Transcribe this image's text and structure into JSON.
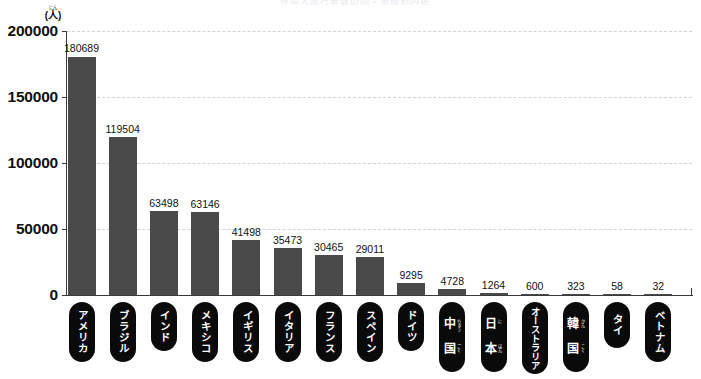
{
  "chart_data": {
    "type": "bar",
    "title": "",
    "xlabel": "",
    "ylabel": "(人)",
    "ylim": [
      0,
      200000
    ],
    "yticks": [
      "0",
      "50000",
      "100000",
      "150000",
      "200000"
    ],
    "grid": true,
    "legend": "none",
    "bar_color": "#4a4a4a",
    "categories": [
      "アメリカ",
      "ブラジル",
      "インド",
      "メキシコ",
      "イギリス",
      "イタリア",
      "フランス",
      "スペイン",
      "ドイツ",
      "中国",
      "日本",
      "オーストラリア",
      "韓国",
      "タイ",
      "ベトナム"
    ],
    "values": [
      180689,
      119504,
      63498,
      63146,
      41498,
      35473,
      30465,
      29011,
      9295,
      4728,
      1264,
      600,
      323,
      58,
      32
    ]
  },
  "axis": {
    "unit_ruby": "にん",
    "unit_base": "(人)",
    "ticks": [
      {
        "label": "200000",
        "value": 200000
      },
      {
        "label": "150000",
        "value": 150000
      },
      {
        "label": "100000",
        "value": 100000
      },
      {
        "label": "50000",
        "value": 50000
      },
      {
        "label": "0",
        "value": 0
      }
    ]
  },
  "bars": [
    {
      "label": "アメリカ",
      "value": 180689,
      "value_label": "180689",
      "ruby": null
    },
    {
      "label": "ブラジル",
      "value": 119504,
      "value_label": "119504",
      "ruby": null
    },
    {
      "label": "インド",
      "value": 63498,
      "value_label": "63498",
      "ruby": null
    },
    {
      "label": "メキシコ",
      "value": 63146,
      "value_label": "63146",
      "ruby": null
    },
    {
      "label": "イギリス",
      "value": 41498,
      "value_label": "41498",
      "ruby": null
    },
    {
      "label": "イタリア",
      "value": 35473,
      "value_label": "35473",
      "ruby": null
    },
    {
      "label": "フランス",
      "value": 30465,
      "value_label": "30465",
      "ruby": null
    },
    {
      "label": "スペイン",
      "value": 29011,
      "value_label": "29011",
      "ruby": null
    },
    {
      "label": "ドイツ",
      "value": 9295,
      "value_label": "9295",
      "ruby": null
    },
    {
      "label": "中国",
      "value": 4728,
      "value_label": "4728",
      "ruby": [
        "ちゅう",
        "ごく"
      ]
    },
    {
      "label": "日本",
      "value": 1264,
      "value_label": "1264",
      "ruby": [
        "に",
        "ほん"
      ]
    },
    {
      "label": "オーストラリア",
      "value": 600,
      "value_label": "600",
      "ruby": null
    },
    {
      "label": "韓国",
      "value": 323,
      "value_label": "323",
      "ruby": [
        "かん",
        "こく"
      ]
    },
    {
      "label": "タイ",
      "value": 58,
      "value_label": "58",
      "ruby": null
    },
    {
      "label": "ベトナム",
      "value": 32,
      "value_label": "32",
      "ruby": null
    }
  ],
  "header": {
    "title_faint": "外国人旅行者数の国・地域別内訳"
  }
}
